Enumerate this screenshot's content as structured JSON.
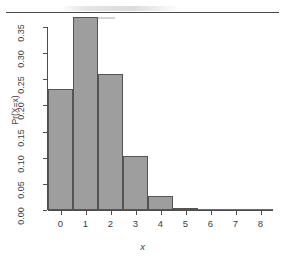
{
  "figure": {
    "kind": "statistical-bar-chart",
    "style": "r-base-graphics"
  },
  "axis_titles": {
    "x": "x",
    "y": "Pr(X=x)"
  },
  "y_ticks": [
    "0.00",
    "0.05",
    "0.10",
    "0.15",
    "0.20",
    "0.25",
    "0.30",
    "0.35"
  ],
  "x_ticks": [
    "0",
    "1",
    "2",
    "3",
    "4",
    "5",
    "6",
    "7",
    "8"
  ],
  "colors": {
    "bar_fill": "#9e9e9e",
    "bar_border": "#545454",
    "axis": "#4d4d4d",
    "text": "#3d3d3d",
    "background": "#ffffff",
    "page_rule": "#4a4a4a"
  },
  "chart_data": {
    "type": "bar",
    "title": "",
    "subtitle": "",
    "xlabel": "x",
    "ylabel": "Pr(X=x)",
    "categories": [
      "0",
      "1",
      "2",
      "3",
      "4",
      "5",
      "6",
      "7",
      "8"
    ],
    "values": [
      0.231,
      0.37,
      0.26,
      0.104,
      0.026,
      0.003,
      0.0005,
      0.0001,
      0.0
    ],
    "xlim": [
      -0.5,
      8.5
    ],
    "ylim": [
      0.0,
      0.37
    ],
    "y_tick_values": [
      0.0,
      0.05,
      0.1,
      0.15,
      0.2,
      0.25,
      0.3,
      0.35
    ],
    "x_tick_values": [
      0,
      1,
      2,
      3,
      4,
      5,
      6,
      7,
      8
    ],
    "grid": false,
    "legend": false,
    "legend_position": "none",
    "bar_width_fraction": 1.0,
    "annotations": []
  }
}
